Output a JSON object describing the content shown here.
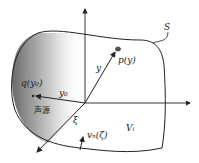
{
  "diagram": {
    "surface_label": "S",
    "point_label": "p(y)",
    "vector_y_label": "y",
    "source_point_label": "q(y₀)",
    "vector_y0_label": "y₀",
    "source_region_label": "声源",
    "vector_xi_label": "ξ",
    "normal_velocity_label": "vₙ(ζ)",
    "volume_label": "Vᵢ",
    "colors": {
      "stroke": "#222222",
      "shade_dark": "#6a6a6a",
      "shade_light": "#ffffff"
    }
  }
}
